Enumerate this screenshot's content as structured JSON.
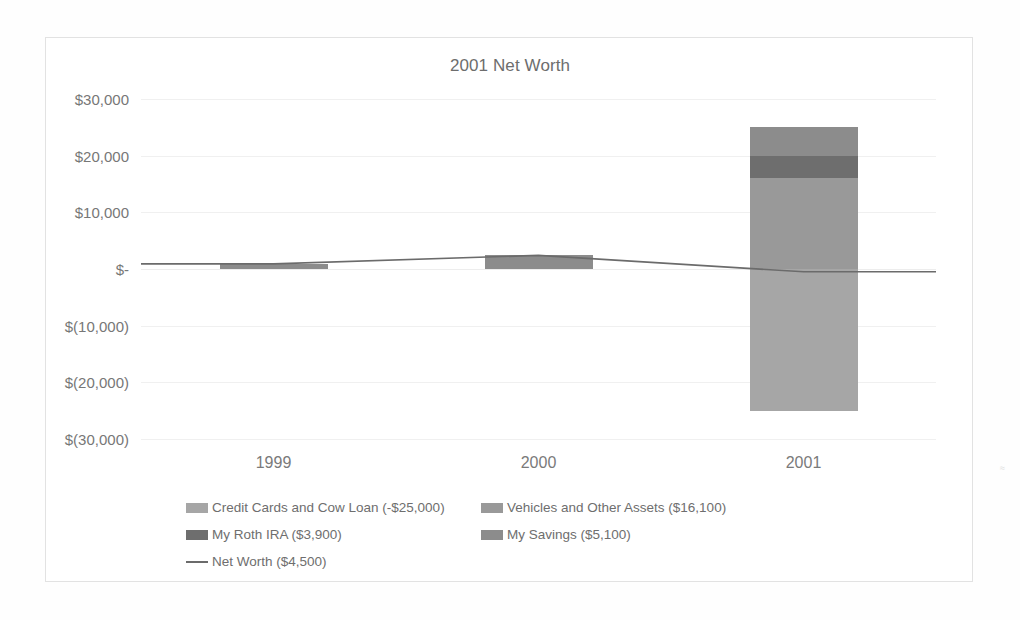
{
  "chart_data": {
    "type": "bar",
    "title": "2001 Net Worth",
    "xlabel": "",
    "ylabel": "",
    "categories": [
      "1999",
      "2000",
      "2001"
    ],
    "ylim": [
      -30000,
      30000
    ],
    "ytick_values": [
      30000,
      20000,
      10000,
      0,
      -10000,
      -20000,
      -30000
    ],
    "ytick_labels": [
      "$30,000",
      "$20,000",
      "$10,000",
      "$-",
      "$(10,000)",
      "$(20,000)",
      "$(30,000)"
    ],
    "grid": true,
    "stacked": true,
    "legend_position": "bottom",
    "series": [
      {
        "name": "Credit Cards and Cow Loan (-$25,000)",
        "label_short": "Credit Cards and Cow Loan",
        "value_label": "-$25,000",
        "type": "bar",
        "color": "#a6a6a6",
        "values": [
          0,
          0,
          -25000
        ]
      },
      {
        "name": "Vehicles and Other Assets ($16,100)",
        "label_short": "Vehicles and Other Assets",
        "value_label": "$16,100",
        "type": "bar",
        "color": "#999999",
        "values": [
          0,
          0,
          16100
        ]
      },
      {
        "name": "My Roth IRA ($3,900)",
        "label_short": "My Roth IRA",
        "value_label": "$3,900",
        "type": "bar",
        "color": "#6e6e6e",
        "values": [
          0,
          0,
          3900
        ]
      },
      {
        "name": "My Savings ($5,100)",
        "label_short": "My Savings",
        "value_label": "$5,100",
        "type": "bar",
        "color": "#8c8c8c",
        "values": [
          900,
          2400,
          5100
        ]
      },
      {
        "name": "Net Worth ($4,500)",
        "label_short": "Net Worth",
        "value_label": "$4,500",
        "type": "line",
        "color": "#6b6b6b",
        "values": [
          900,
          2400,
          -500
        ]
      }
    ]
  },
  "legend": {
    "items": [
      {
        "label": "Credit Cards and Cow Loan (-$25,000)",
        "color": "#a6a6a6",
        "marker": "swatch"
      },
      {
        "label": "Vehicles and Other Assets ($16,100)",
        "color": "#999999",
        "marker": "swatch"
      },
      {
        "label": "My Roth IRA ($3,900)",
        "color": "#6e6e6e",
        "marker": "swatch"
      },
      {
        "label": "My Savings ($5,100)",
        "color": "#8c8c8c",
        "marker": "swatch"
      },
      {
        "label": "Net Worth ($4,500)",
        "color": "#6b6b6b",
        "marker": "line"
      }
    ]
  },
  "edge_artifact": "≈"
}
